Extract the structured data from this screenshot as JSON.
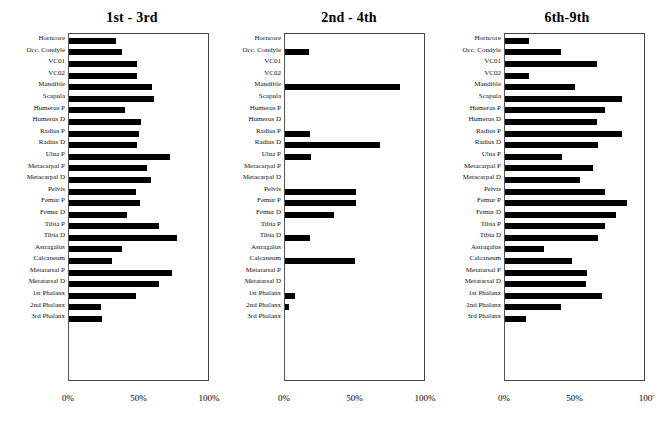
{
  "figure": {
    "axis_ticks": [
      "0%",
      "50%",
      "100%"
    ],
    "axis_ticks_panel3": [
      "0%",
      "50%",
      "100'"
    ],
    "bar_color": "#000000",
    "categories": [
      "Horncore",
      "Occ. Condyle",
      "VC01",
      "VC02",
      "Mandible",
      "Scapula",
      "Humerus P",
      "Humerus D",
      "Radius P",
      "Radius D",
      "Ulna P",
      "Metacarpal P",
      "Metacarpal D",
      "Pelvis",
      "Femur P",
      "Femur D",
      "Tibia P",
      "Tibia D",
      "Astragalus",
      "Calcaneum",
      "Metatarsal P",
      "Metatarsal D",
      "1st Phalanx",
      "2nd Phalanx",
      "3rd Phalanx"
    ]
  },
  "chart_data": [
    {
      "type": "bar",
      "title": "1st - 3rd",
      "orientation": "horizontal",
      "xlabel": "",
      "ylabel": "",
      "xlim": [
        0,
        100
      ],
      "xticks": [
        0,
        50,
        100
      ],
      "xticklabels": [
        "0%",
        "50%",
        "100%"
      ],
      "grid": false,
      "legend": "none",
      "categories": [
        "Horncore",
        "Occ. Condyle",
        "VC01",
        "VC02",
        "Mandible",
        "Scapula",
        "Humerus P",
        "Humerus D",
        "Radius P",
        "Radius D",
        "Ulna P",
        "Metacarpal P",
        "Metacarpal D",
        "Pelvis",
        "Femur P",
        "Femur D",
        "Tibia P",
        "Tibia D",
        "Astragalus",
        "Calcaneum",
        "Metatarsal P",
        "Metatarsal D",
        "1st Phalanx",
        "2nd Phalanx",
        "3rd Phalanx"
      ],
      "values": [
        34,
        38,
        49,
        49,
        60,
        61,
        40,
        52,
        50,
        49,
        73,
        56,
        59,
        48,
        51,
        42,
        65,
        78,
        38,
        31,
        74,
        65,
        48,
        23,
        24
      ]
    },
    {
      "type": "bar",
      "title": "2nd - 4th",
      "orientation": "horizontal",
      "xlabel": "",
      "ylabel": "",
      "xlim": [
        0,
        100
      ],
      "xticks": [
        0,
        50,
        100
      ],
      "xticklabels": [
        "0%",
        "50%",
        "100%"
      ],
      "grid": false,
      "legend": "none",
      "categories": [
        "Horncore",
        "Occ. Condyle",
        "VC01",
        "VC02",
        "Mandible",
        "Scapula",
        "Humerus P",
        "Humerus D",
        "Radius P",
        "Radius D",
        "Ulna P",
        "Metacarpal P",
        "Metacarpal D",
        "Pelvis",
        "Femur P",
        "Femur D",
        "Tibia P",
        "Tibia D",
        "Astragalus",
        "Calcaneum",
        "Metatarsal P",
        "Metatarsal D",
        "1st Phalanx",
        "2nd Phalanx",
        "3rd Phalanx"
      ],
      "values": [
        0,
        17,
        0,
        0,
        83,
        0,
        0,
        0,
        18,
        68,
        19,
        0,
        0,
        51,
        51,
        35,
        0,
        18,
        0,
        50,
        0,
        0,
        7,
        3,
        0
      ]
    },
    {
      "type": "bar",
      "title": "6th-9th",
      "orientation": "horizontal",
      "xlabel": "",
      "ylabel": "",
      "xlim": [
        0,
        100
      ],
      "xticks": [
        0,
        50,
        100
      ],
      "xticklabels": [
        "0%",
        "50%",
        "100'"
      ],
      "grid": false,
      "legend": "none",
      "categories": [
        "Horncore",
        "Occ. Condyle",
        "VC01",
        "VC02",
        "Mandible",
        "Scapula",
        "Humerus P",
        "Humerus D",
        "Radius P",
        "Radius D",
        "Ulna P",
        "Metacarpal P",
        "Metacarpal D",
        "Pelvis",
        "Femur P",
        "Femur D",
        "Tibia P",
        "Tibia D",
        "Astragalus",
        "Calcaneum",
        "Metatarsal P",
        "Metatarsal D",
        "1st Phalanx",
        "2nd Phalanx",
        "3rd Phalanx"
      ],
      "values": [
        17,
        40,
        66,
        17,
        50,
        84,
        72,
        66,
        84,
        67,
        41,
        63,
        54,
        72,
        88,
        80,
        72,
        67,
        28,
        48,
        59,
        58,
        70,
        40,
        15
      ]
    }
  ]
}
